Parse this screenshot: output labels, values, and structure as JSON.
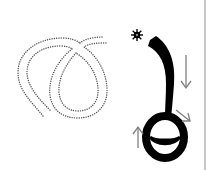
{
  "worksheet": {
    "type": "stroke-order-practice",
    "trace_figure": {
      "style": "dotted-outline",
      "color": "#555555"
    },
    "demo_stroke": {
      "color": "#000000"
    },
    "markers": {
      "start": "star-icon",
      "arrows": [
        "arrow-down-icon",
        "arrow-down-right-icon",
        "arrow-up-icon"
      ],
      "arrow_color": "#808080"
    },
    "divider_color": "#c8c8c8"
  }
}
